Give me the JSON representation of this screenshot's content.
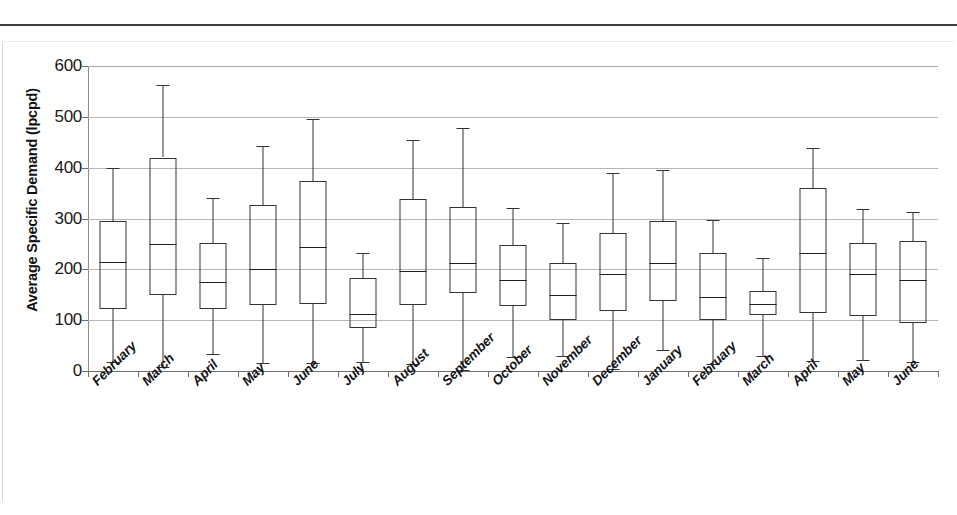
{
  "document": {
    "top_rule_present": true,
    "scan_artifact_text": ""
  },
  "chart_data": {
    "type": "box",
    "title": "",
    "xlabel": "",
    "ylabel": "Average Specific Demand (lpcpd)",
    "ylim": [
      0,
      600
    ],
    "yticks": [
      0,
      100,
      200,
      300,
      400,
      500,
      600
    ],
    "ytick_labels": [
      "0",
      "100",
      "200",
      "300",
      "400",
      "500",
      "600"
    ],
    "grid": true,
    "legend": "none",
    "categories": [
      "February",
      "March",
      "April",
      "May",
      "June",
      "July",
      "August",
      "September",
      "October",
      "November",
      "December",
      "January",
      "February",
      "March",
      "April",
      "May",
      "June"
    ],
    "boxes": [
      {
        "category": "February",
        "whisker_low": 18,
        "q1": 122,
        "median": 215,
        "q3": 295,
        "whisker_high": 400
      },
      {
        "category": "March",
        "whisker_low": 8,
        "q1": 150,
        "median": 250,
        "q3": 420,
        "whisker_high": 562
      },
      {
        "category": "April",
        "whisker_low": 33,
        "q1": 122,
        "median": 175,
        "q3": 252,
        "whisker_high": 340
      },
      {
        "category": "May",
        "whisker_low": 15,
        "q1": 130,
        "median": 200,
        "q3": 327,
        "whisker_high": 442
      },
      {
        "category": "June",
        "whisker_low": 15,
        "q1": 132,
        "median": 243,
        "q3": 373,
        "whisker_high": 495
      },
      {
        "category": "July",
        "whisker_low": 17,
        "q1": 85,
        "median": 113,
        "q3": 182,
        "whisker_high": 232
      },
      {
        "category": "August",
        "whisker_low": 13,
        "q1": 130,
        "median": 197,
        "q3": 338,
        "whisker_high": 455
      },
      {
        "category": "September",
        "whisker_low": 2,
        "q1": 153,
        "median": 212,
        "q3": 323,
        "whisker_high": 478
      },
      {
        "category": "October",
        "whisker_low": 28,
        "q1": 127,
        "median": 180,
        "q3": 248,
        "whisker_high": 320
      },
      {
        "category": "November",
        "whisker_low": 30,
        "q1": 100,
        "median": 150,
        "q3": 213,
        "whisker_high": 292
      },
      {
        "category": "December",
        "whisker_low": 3,
        "q1": 118,
        "median": 190,
        "q3": 272,
        "whisker_high": 390
      },
      {
        "category": "January",
        "whisker_low": 42,
        "q1": 138,
        "median": 213,
        "q3": 295,
        "whisker_high": 395
      },
      {
        "category": "February",
        "whisker_low": 13,
        "q1": 100,
        "median": 145,
        "q3": 232,
        "whisker_high": 297
      },
      {
        "category": "March",
        "whisker_low": 30,
        "q1": 110,
        "median": 132,
        "q3": 158,
        "whisker_high": 222
      },
      {
        "category": "April",
        "whisker_low": 20,
        "q1": 115,
        "median": 232,
        "q3": 360,
        "whisker_high": 438
      },
      {
        "category": "May",
        "whisker_low": 22,
        "q1": 108,
        "median": 190,
        "q3": 252,
        "whisker_high": 318
      },
      {
        "category": "June",
        "whisker_low": 17,
        "q1": 95,
        "median": 180,
        "q3": 255,
        "whisker_high": 312
      }
    ],
    "colors": {
      "box_stroke": "#333336",
      "median": "#1f1f22",
      "gridline": "#b6b6ba",
      "axis": "#6f6f72",
      "text": "#111111"
    }
  }
}
